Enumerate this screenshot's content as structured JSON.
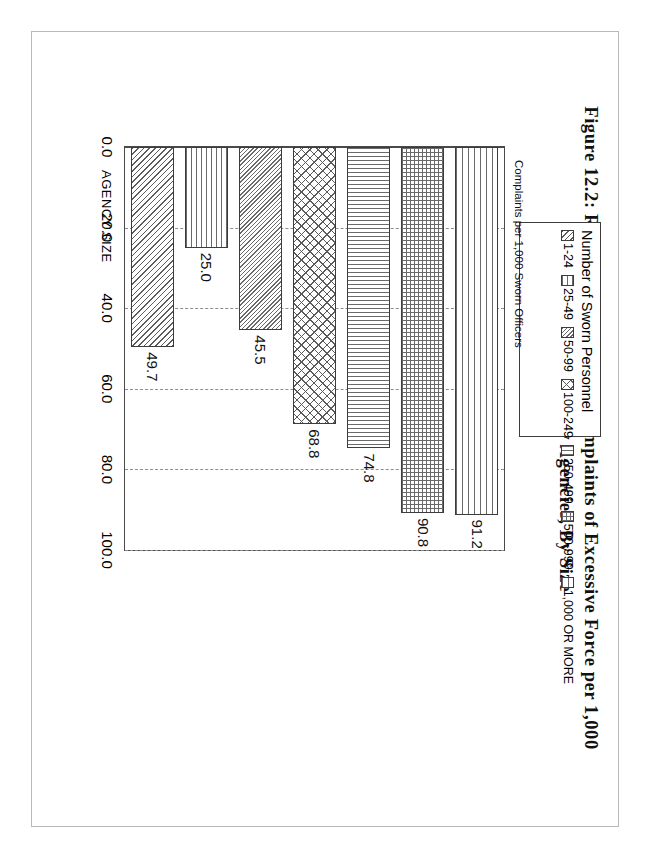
{
  "figure": {
    "title": "Figure 12.2: Reported 1991 Citizen Complaints of Excessive Force per 1,000 Sworn Officers: City Agencies, By Size"
  },
  "legend": {
    "title": "Number of Sworn Personnel",
    "items": [
      {
        "label": "1-24",
        "pattern": "diagonal-hatch"
      },
      {
        "label": "25-49",
        "pattern": "horizontal-lines"
      },
      {
        "label": "50-99",
        "pattern": "fine-diagonal-hatch"
      },
      {
        "label": "100-249",
        "pattern": "cross-hatch"
      },
      {
        "label": "250-499",
        "pattern": "vertical-lines"
      },
      {
        "label": "500-999",
        "pattern": "grid-fill"
      },
      {
        "label": "1,000 OR MORE",
        "pattern": "wide-horizontal-lines"
      }
    ]
  },
  "axes": {
    "category_axis_title": "AGENCY SIZE",
    "value_axis_title": "Complaints per 1,000 Sworn Officers",
    "value_ticks": [
      "100.0",
      "80.0",
      "60.0",
      "40.0",
      "20.0",
      "0.0"
    ]
  },
  "chart_data": {
    "type": "bar",
    "orientation": "horizontal",
    "title": "Figure 12.2: Reported 1991 Citizen Complaints of Excessive Force per 1,000 Sworn Officers: City Agencies, By Size",
    "xlabel": "AGENCY SIZE",
    "ylabel": "Complaints per 1,000 Sworn Officers",
    "categories": [
      "1-24",
      "25-49",
      "50-99",
      "100-249",
      "250-499",
      "500-999",
      "1,000 OR MORE"
    ],
    "values": [
      49.7,
      25.0,
      45.5,
      68.8,
      74.8,
      90.8,
      91.2
    ],
    "data_labels": [
      "49.7",
      "25.0",
      "45.5",
      "68.8",
      "74.8",
      "90.8",
      "91.2"
    ],
    "ylim": [
      0.0,
      100.0
    ],
    "tick_values": [
      0.0,
      20.0,
      40.0,
      60.0,
      80.0,
      100.0
    ],
    "grid": "dashed-value-gridlines",
    "legend_position": "top-right-outside",
    "legend_title": "Number of Sworn Personnel",
    "patterns": [
      "diagonal-hatch",
      "horizontal-lines",
      "fine-diagonal-hatch",
      "cross-hatch",
      "vertical-lines",
      "grid-fill",
      "wide-horizontal-lines"
    ],
    "colors": {
      "bar_outline": "#3c3c3c",
      "hatch": "#5d5d5d",
      "background": "#ffffff",
      "grid": "#8d8d8d"
    }
  }
}
